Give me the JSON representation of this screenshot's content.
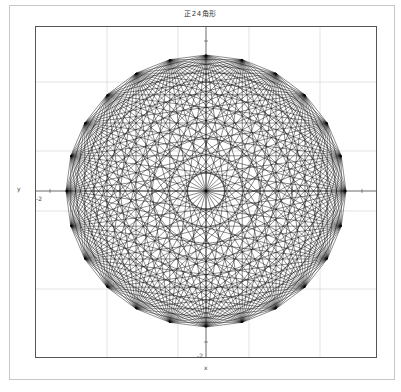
{
  "chart_data": {
    "type": "line",
    "title": "正24角形",
    "xlabel": "x",
    "ylabel": "y",
    "polygon": {
      "vertices": 24,
      "all_diagonals_drawn": true,
      "radius": 1
    },
    "tick_labels": {
      "x_axis_bottom": "-2",
      "y_axis_left": "-2",
      "x_axis_minor": "1",
      "y_axis_minor": "1"
    },
    "grid": true,
    "legend": "none",
    "colors": {
      "line": "#000000",
      "grid": "#d0d0d0",
      "frame": "#555555",
      "outer_frame": "#c8c8c8"
    }
  }
}
